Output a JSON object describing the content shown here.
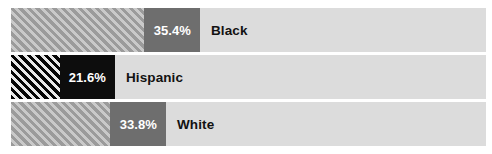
{
  "chart_data": {
    "type": "bar",
    "orientation": "horizontal",
    "title": "",
    "subtitle": "",
    "xlabel": "",
    "ylabel": "",
    "legend": [],
    "grid": false,
    "xlim": [
      0,
      100
    ],
    "value_unit": "%",
    "categories": [
      "Black",
      "Hispanic",
      "White"
    ],
    "values": [
      35.4,
      21.6,
      33.8
    ],
    "value_labels": [
      "35.4%",
      "21.6%",
      "33.8%"
    ],
    "bars": [
      {
        "category": "Black",
        "value": 35.4,
        "value_label": "35.4%",
        "style": "hatched-gray",
        "bar_color": "#6e6e6e",
        "hatch_color": "#9b9b9b",
        "track_color": "#dcdcdc",
        "value_text_color": "#ffffff",
        "label_text_color": "#121212"
      },
      {
        "category": "Hispanic",
        "value": 21.6,
        "value_label": "21.6%",
        "style": "hatched-black",
        "bar_color": "#0d0d0d",
        "hatch_color": "#050505",
        "track_color": "#dcdcdc",
        "value_text_color": "#ffffff",
        "label_text_color": "#121212"
      },
      {
        "category": "White",
        "value": 33.8,
        "value_label": "33.8%",
        "style": "hatched-gray",
        "bar_color": "#6e6e6e",
        "hatch_color": "#9b9b9b",
        "track_color": "#dcdcdc",
        "value_text_color": "#ffffff",
        "label_text_color": "#121212"
      }
    ]
  },
  "layout": {
    "background": "#ffffff",
    "bar_left": 11,
    "bar_width": 475,
    "rows": [
      {
        "top": 8,
        "height": 44,
        "hatch_width": 133,
        "value_width": 56
      },
      {
        "top": 55,
        "height": 44,
        "hatch_width": 49,
        "value_width": 55
      },
      {
        "top": 102,
        "height": 44,
        "hatch_width": 99,
        "value_width": 56
      }
    ]
  }
}
